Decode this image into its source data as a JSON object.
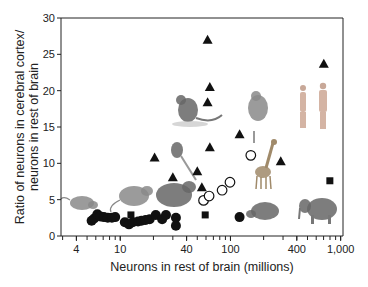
{
  "chart_data": {
    "type": "scatter",
    "title": "",
    "xlabel": "Neurons in rest of brain (millions)",
    "ylabel_line1": "Ratio of neurons in cerebral cortex/",
    "ylabel_line2": "neurons in rest of brain",
    "xscale": "log",
    "xlim": [
      2.9,
      1050
    ],
    "ylim": [
      0,
      30
    ],
    "x_ticks": [
      4,
      10,
      40,
      100,
      400,
      1000
    ],
    "x_tick_labels": [
      "4",
      "10",
      "40",
      "100",
      "400",
      "1,000"
    ],
    "y_ticks": [
      0,
      5,
      10,
      15,
      20,
      25,
      30
    ],
    "y_tick_labels": [
      "0",
      "5",
      "10",
      "15",
      "20",
      "25",
      "30"
    ],
    "grid": false,
    "legend": null,
    "series": [
      {
        "name": "filled-circles",
        "marker": "circle-filled",
        "points": [
          [
            5.5,
            2.1
          ],
          [
            5.8,
            2.4
          ],
          [
            6.2,
            3.0
          ],
          [
            6.6,
            2.7
          ],
          [
            7.1,
            2.6
          ],
          [
            7.7,
            2.5
          ],
          [
            8.4,
            2.5
          ],
          [
            9.0,
            2.6
          ],
          [
            11.0,
            1.9
          ],
          [
            12.0,
            1.6
          ],
          [
            13.0,
            1.9
          ],
          [
            14.5,
            2.0
          ],
          [
            15.6,
            2.1
          ],
          [
            17.0,
            2.2
          ],
          [
            18.5,
            2.3
          ],
          [
            21.0,
            2.9
          ],
          [
            24.0,
            2.3
          ],
          [
            26.0,
            2.9
          ],
          [
            32.0,
            2.5
          ],
          [
            32.0,
            1.4
          ],
          [
            121,
            2.6
          ]
        ]
      },
      {
        "name": "open-circles",
        "marker": "circle-open",
        "points": [
          [
            57,
            4.9
          ],
          [
            64,
            5.5
          ],
          [
            84,
            6.3
          ],
          [
            99,
            7.4
          ],
          [
            153,
            11.1
          ]
        ]
      },
      {
        "name": "filled-squares",
        "marker": "square",
        "points": [
          [
            12.5,
            2.9
          ],
          [
            59,
            2.9
          ],
          [
            798,
            7.6
          ]
        ]
      },
      {
        "name": "filled-triangles",
        "marker": "triangle",
        "points": [
          [
            20.5,
            10.8
          ],
          [
            30,
            8.1
          ],
          [
            50,
            8.9
          ],
          [
            55,
            6.7
          ],
          [
            65,
            12.2
          ],
          [
            62,
            27.0
          ],
          [
            65,
            20.5
          ],
          [
            62,
            18.4
          ],
          [
            121,
            14.0
          ],
          [
            286,
            10.3
          ],
          [
            703,
            23.7
          ]
        ]
      }
    ],
    "annotations": [
      {
        "type": "image",
        "label": "shrew",
        "x": 4.5,
        "y": 4.5
      },
      {
        "type": "image",
        "label": "mouse",
        "x": 9,
        "y": 5.5
      },
      {
        "type": "image",
        "label": "rat",
        "x": 26,
        "y": 5
      },
      {
        "type": "image",
        "label": "tree-shrew",
        "x": 33,
        "y": 11
      },
      {
        "type": "image",
        "label": "monkey",
        "x": 55,
        "y": 17
      },
      {
        "type": "image",
        "label": "macaque",
        "x": 140,
        "y": 16
      },
      {
        "type": "image",
        "label": "giraffe",
        "x": 170,
        "y": 8
      },
      {
        "type": "image",
        "label": "humans",
        "x": 500,
        "y": 17
      },
      {
        "type": "image",
        "label": "capybara",
        "x": 190,
        "y": 2.5
      },
      {
        "type": "image",
        "label": "elephant",
        "x": 650,
        "y": 2.5
      }
    ]
  }
}
